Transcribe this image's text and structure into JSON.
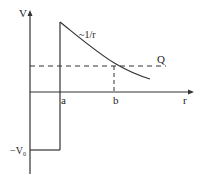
{
  "diagram": {
    "labels": {
      "y_axis": "V",
      "x_axis": "r",
      "curve": "~1/r",
      "energy_level": "Q",
      "point_a": "a",
      "point_b": "b",
      "well_depth_main": "−V",
      "well_depth_sub": "0"
    },
    "colors": {
      "line": "#222222",
      "background": "#ffffff"
    }
  }
}
